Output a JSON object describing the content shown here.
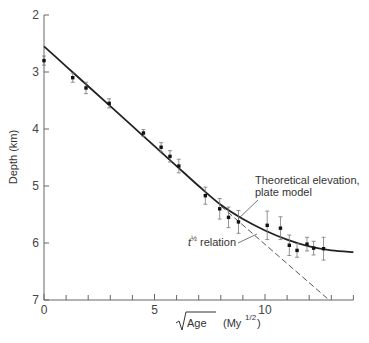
{
  "chart_data": {
    "type": "scatter",
    "title": "",
    "xlabel": "√Age (My^1/2)",
    "xlabel_parts": {
      "root": "Age",
      "unit": "(My",
      "exp": "1/2",
      "close": ")"
    },
    "ylabel": "Depth (km)",
    "xlim": [
      0,
      14
    ],
    "ylim": [
      7,
      2
    ],
    "y_inverted": true,
    "x_ticks": [
      0,
      1,
      2,
      3,
      4,
      5,
      6,
      7,
      8,
      9,
      10,
      11,
      12,
      13,
      14
    ],
    "x_tick_labels": {
      "0": "0",
      "5": "5",
      "10": "10"
    },
    "y_ticks": [
      2,
      3,
      4,
      5,
      6,
      7
    ],
    "y_tick_labels": [
      "2",
      "3",
      "4",
      "5",
      "6",
      "7"
    ],
    "grid": false,
    "series": [
      {
        "name": "Observed depth",
        "style": "points-with-error-bars",
        "x": [
          0.0,
          1.3,
          1.9,
          2.95,
          4.5,
          5.3,
          5.7,
          6.1,
          7.3,
          7.95,
          8.35,
          8.8,
          10.1,
          10.7,
          11.1,
          11.45,
          11.9,
          12.2,
          12.65
        ],
        "y": [
          2.8,
          3.1,
          3.28,
          3.55,
          4.07,
          4.32,
          4.48,
          4.65,
          5.17,
          5.4,
          5.55,
          5.63,
          5.69,
          5.74,
          6.04,
          6.13,
          6.02,
          6.09,
          6.1
        ],
        "error": [
          0.08,
          0.08,
          0.1,
          0.08,
          0.06,
          0.08,
          0.1,
          0.12,
          0.15,
          0.18,
          0.18,
          0.2,
          0.25,
          0.2,
          0.18,
          0.12,
          0.12,
          0.12,
          0.2
        ]
      },
      {
        "name": "Theoretical elevation, plate model",
        "style": "solid-line",
        "x": [
          0,
          1,
          2,
          3,
          4,
          5,
          6,
          7,
          8,
          9,
          10,
          11,
          12,
          13,
          14
        ],
        "y": [
          2.55,
          2.9,
          3.25,
          3.6,
          3.95,
          4.3,
          4.65,
          5.0,
          5.33,
          5.58,
          5.78,
          5.94,
          6.06,
          6.13,
          6.16
        ]
      },
      {
        "name": "t^1/2 relation",
        "style": "dashed-line",
        "x": [
          8,
          12.9
        ],
        "y": [
          5.35,
          7.0
        ]
      }
    ],
    "annotations": [
      {
        "text": "Theoretical elevation,",
        "line2": "plate model",
        "points_to": [
          8.4,
          5.42
        ]
      },
      {
        "text": "t",
        "superscript": "½",
        "suffix": " relation",
        "points_to": [
          9.6,
          6.0
        ]
      }
    ]
  }
}
